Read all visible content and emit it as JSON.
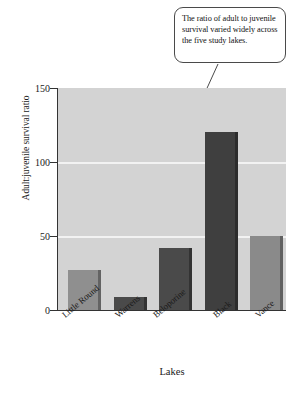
{
  "chart_data": {
    "type": "bar",
    "title": "",
    "categories": [
      "Little Round",
      "Warrens",
      "Beloporine",
      "Black",
      "Vance"
    ],
    "values": [
      27,
      9,
      42,
      120,
      50
    ],
    "series": [
      {
        "name": "Adult:juvenile survival ratio",
        "values": [
          27,
          9,
          42,
          120,
          50
        ]
      }
    ],
    "xlabel": "Lakes",
    "ylabel": "Adult:juvenile survival ratio",
    "ylim": [
      0,
      150
    ],
    "yticks": [
      0,
      50,
      100,
      150
    ],
    "ytick_labels": [
      "0",
      "50",
      "100",
      "150"
    ],
    "grid": true,
    "gridlines_at": [
      50,
      100
    ],
    "legend": "none",
    "bar_colors": [
      "#8f8f8f",
      "#4a4a4a",
      "#4a4a4a",
      "#3f3f3f",
      "#8a8a8a"
    ],
    "plot_background": "#d3d3d3",
    "gridline_color": "#f2f2f2",
    "axis_color": "#333333",
    "annotations": [
      {
        "name": "callout",
        "text": "The ratio of adult to juvenile survival varied widely across the five study lakes.",
        "points_to": "Black"
      }
    ]
  },
  "annotation": {
    "callout_text": "The ratio of adult to juvenile survival varied widely across the five study lakes."
  },
  "axes": {
    "x_title": "Lakes",
    "y_title": "Adult:juvenile survival ratio"
  }
}
